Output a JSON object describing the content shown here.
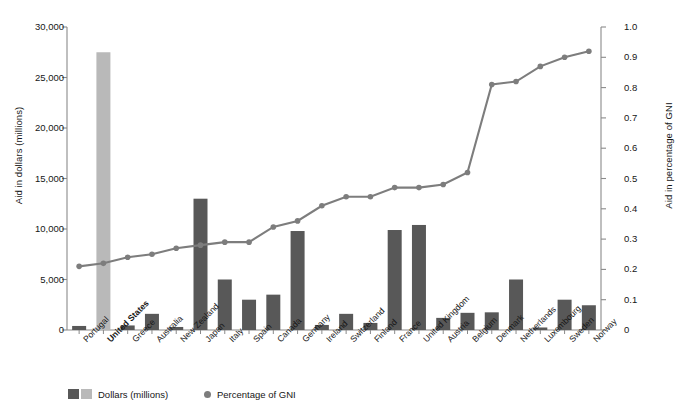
{
  "chart_data": {
    "type": "bar",
    "title": "",
    "subtitle": "",
    "categories": [
      "Portugal",
      "United States",
      "Greece",
      "Australia",
      "New Zealand",
      "Japan",
      "Italy",
      "Spain",
      "Canada",
      "Germany",
      "Ireland",
      "Switzerland",
      "Finland",
      "France",
      "United Kingdom",
      "Austria",
      "Belgium",
      "Denmark",
      "Netherlands",
      "Luxembourg",
      "Sweden",
      "Norway"
    ],
    "highlight_category": "United States",
    "series": [
      {
        "name": "Dollars (millions)",
        "type": "bar",
        "axis": "left",
        "color": "#585858",
        "highlight_color": "#b9b9b9",
        "values": [
          400,
          27500,
          450,
          1600,
          300,
          13000,
          5000,
          3000,
          3500,
          9800,
          500,
          1600,
          700,
          9900,
          10400,
          1200,
          1700,
          1750,
          5000,
          250,
          3000,
          2450
        ]
      },
      {
        "name": "Percentage of GNI",
        "type": "line",
        "axis": "right",
        "color": "#7d7d7d",
        "values": [
          0.21,
          0.22,
          0.24,
          0.25,
          0.27,
          0.28,
          0.29,
          0.29,
          0.34,
          0.36,
          0.41,
          0.44,
          0.44,
          0.47,
          0.47,
          0.48,
          0.52,
          0.81,
          0.82,
          0.87,
          0.9,
          0.92
        ]
      }
    ],
    "xlabel": "",
    "ylabel": "Aid in dollars (millions)",
    "y2label": "Aid in percentage of GNI",
    "ylim": [
      0,
      30000
    ],
    "y2lim": [
      0,
      1.0
    ],
    "yticks": [
      "0",
      "5,000",
      "10,000",
      "15,000",
      "20,000",
      "25,000",
      "30,000"
    ],
    "ytick_values": [
      0,
      5000,
      10000,
      15000,
      20000,
      25000,
      30000
    ],
    "y2ticks": [
      "0",
      "0.1",
      "0.2",
      "0.3",
      "0.4",
      "0.5",
      "0.6",
      "0.7",
      "0.8",
      "0.9",
      "1.0"
    ],
    "y2tick_values": [
      0,
      0.1,
      0.2,
      0.3,
      0.4,
      0.5,
      0.6,
      0.7,
      0.8,
      0.9,
      1.0
    ],
    "grid": false,
    "legend_position": "bottom-left",
    "legend": [
      {
        "label": "Dollars (millions)",
        "marker": "swatch-pair",
        "colors": [
          "#585858",
          "#b9b9b9"
        ]
      },
      {
        "label": "Percentage of GNI",
        "marker": "dot",
        "colors": [
          "#7d7d7d"
        ]
      }
    ]
  },
  "colors": {
    "background": "#ffffff",
    "axis": "#8a8a8a",
    "text": "#161616",
    "bar_dark": "#585858",
    "bar_light": "#b9b9b9",
    "line": "#7d7d7d"
  }
}
